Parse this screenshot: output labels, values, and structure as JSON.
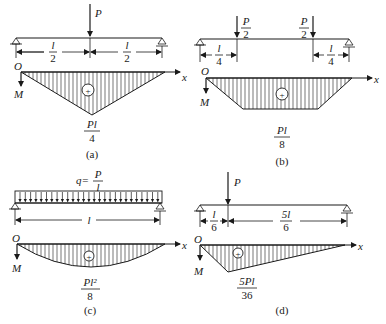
{
  "panels": [
    {
      "id": "a",
      "caption": "(a)",
      "loads": [
        {
          "label": "P"
        }
      ],
      "dimensions": [
        {
          "num": "l",
          "den": "2"
        },
        {
          "num": "l",
          "den": "2"
        }
      ],
      "axis": {
        "origin": "O",
        "x": "x",
        "y": "M"
      },
      "sign": "+",
      "max_moment": {
        "num": "Pl",
        "den": "4"
      }
    },
    {
      "id": "b",
      "caption": "(b)",
      "loads": [
        {
          "num": "P",
          "den": "2"
        },
        {
          "num": "P",
          "den": "2"
        }
      ],
      "dimensions": [
        {
          "num": "l",
          "den": "4"
        },
        {
          "num": "l",
          "den": "4"
        }
      ],
      "axis": {
        "origin": "O",
        "x": "x",
        "y": "M"
      },
      "sign": "+",
      "max_moment": {
        "num": "Pl",
        "den": "8"
      }
    },
    {
      "id": "c",
      "caption": "(c)",
      "load": {
        "prefix": "q=",
        "num": "P",
        "den": "l"
      },
      "dimensions": [
        {
          "label": "l"
        }
      ],
      "axis": {
        "origin": "O",
        "x": "x",
        "y": "M"
      },
      "sign": "+",
      "max_moment": {
        "num": "Pl²",
        "den": "8"
      }
    },
    {
      "id": "d",
      "caption": "(d)",
      "loads": [
        {
          "label": "P"
        }
      ],
      "dimensions": [
        {
          "num": "l",
          "den": "6"
        },
        {
          "num": "5l",
          "den": "6"
        }
      ],
      "axis": {
        "origin": "O",
        "x": "x",
        "y": "M"
      },
      "sign": "+",
      "max_moment": {
        "num": "5Pl",
        "den": "36"
      }
    }
  ]
}
